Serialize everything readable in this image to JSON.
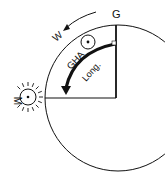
{
  "diagram": {
    "labels": {
      "greenwich": "G",
      "west": "W",
      "sun_body": "M",
      "gha": "GHA",
      "longitude": "Long."
    },
    "icons": {
      "sun": "sun-icon",
      "celestial_body": "circled-dot-icon",
      "direction_arrow": "arrow-icon"
    },
    "colors": {
      "ink": "#111111",
      "background": "#ffffff"
    }
  }
}
